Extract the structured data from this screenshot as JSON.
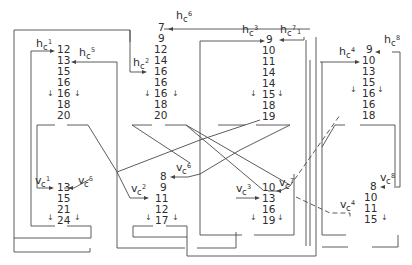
{
  "diagram": {
    "type": "sorting-network-columns",
    "columns": [
      {
        "id": "col1",
        "h_label": {
          "base": "h",
          "sub": "c",
          "sup": "1"
        },
        "h_values": [
          "12",
          "13",
          "15",
          "16",
          "16",
          "18",
          "20"
        ],
        "v_label": {
          "base": "v",
          "sub": "c",
          "sup": "1"
        },
        "v_values": [
          "13",
          "15",
          "21",
          "24"
        ]
      },
      {
        "id": "col2",
        "h_label": {
          "base": "h",
          "sub": "c",
          "sup": "2"
        },
        "h_values": [
          "7",
          "9",
          "12",
          "14",
          "16",
          "16",
          "16",
          "18",
          "20"
        ],
        "v_label": {
          "base": "v",
          "sub": "c",
          "sup": "2"
        },
        "v_values": [
          "8",
          "9",
          "11",
          "12",
          "17"
        ]
      },
      {
        "id": "col3",
        "h_label": {
          "base": "h",
          "sub": "c",
          "sup": "3"
        },
        "h_values": [
          "9",
          "10",
          "11",
          "14",
          "14",
          "15",
          "18",
          "19"
        ],
        "v_label": {
          "base": "v",
          "sub": "c",
          "sup": "3"
        },
        "v_values": [
          "10",
          "13",
          "16",
          "19"
        ]
      },
      {
        "id": "col4",
        "h_label": {
          "base": "h",
          "sub": "c",
          "sup": "4"
        },
        "h_values": [
          "9",
          "10",
          "13",
          "15",
          "16",
          "16",
          "18"
        ],
        "v_label": {
          "base": "v",
          "sub": "c",
          "sup": "4"
        },
        "v_values": [
          "8",
          "10",
          "11",
          "15"
        ]
      }
    ],
    "extra_labels": {
      "hc5": {
        "base": "h",
        "sub": "c",
        "sup": "5"
      },
      "hc6": {
        "base": "h",
        "sub": "c",
        "sup": "6"
      },
      "hc7": {
        "base": "h",
        "sub": "c",
        "sup": "7"
      },
      "hc8": {
        "base": "h",
        "sub": "c",
        "sup": "8"
      },
      "vc5": {
        "base": "v",
        "sub": "c",
        "sup": "5"
      },
      "vc6": {
        "base": "v",
        "sub": "c",
        "sup": "6"
      },
      "vc7": {
        "base": "v",
        "sub": "c",
        "sup": "7"
      },
      "vc8": {
        "base": "v",
        "sub": "c",
        "sup": "8"
      }
    },
    "hc7_trailing_mark": "1",
    "down_arrow_glyph": "↓"
  }
}
